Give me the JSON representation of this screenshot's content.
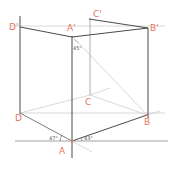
{
  "diagram": {
    "colors": {
      "edge": "#4a4a4a",
      "construction": "#c8c8c8",
      "label": "#e8765a",
      "background": "#ffffff"
    },
    "vertices": {
      "A": {
        "label": "A",
        "x": 72,
        "y": 141
      },
      "B": {
        "label": "B",
        "x": 147,
        "y": 115
      },
      "C": {
        "label": "C",
        "x": 90,
        "y": 95
      },
      "D": {
        "label": "D",
        "x": 20,
        "y": 113
      },
      "A1": {
        "label": "A'",
        "x": 72,
        "y": 36
      },
      "B1": {
        "label": "B'",
        "x": 148,
        "y": 28
      },
      "C1": {
        "label": "C'",
        "x": 92,
        "y": 16
      },
      "D1": {
        "label": "D'",
        "x": 20,
        "y": 27
      }
    },
    "angles": {
      "left": "47°",
      "right": "43°",
      "top": "45°"
    }
  }
}
